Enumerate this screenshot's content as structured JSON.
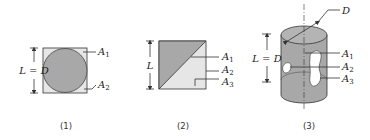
{
  "colors": {
    "dark_fill": "#a8a8a8",
    "light_fill": "#e6e6e6",
    "outline": "#333333",
    "background": "#ffffff"
  },
  "panels": [
    {
      "caption": "(1)",
      "dimension_label": "L = D",
      "areas": [
        {
          "name": "A",
          "sub": "1"
        },
        {
          "name": "A",
          "sub": "2"
        }
      ]
    },
    {
      "caption": "(2)",
      "dimension_label": "L",
      "areas": [
        {
          "name": "A",
          "sub": "1"
        },
        {
          "name": "A",
          "sub": "2"
        },
        {
          "name": "A",
          "sub": "3"
        }
      ]
    },
    {
      "caption": "(3)",
      "dimension_label": "L = D",
      "diameter_label": "D",
      "areas": [
        {
          "name": "A",
          "sub": "1"
        },
        {
          "name": "A",
          "sub": "2"
        },
        {
          "name": "A",
          "sub": "3"
        }
      ]
    }
  ]
}
